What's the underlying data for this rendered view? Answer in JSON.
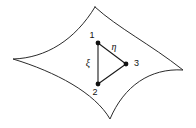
{
  "figure": {
    "name": "curved-surface-with-triangular-element",
    "background_color": "#ffffff",
    "line_color": "#2b2b2b",
    "width": 196,
    "height": 128
  },
  "surface": {
    "name": "curved-surface-patch",
    "description": "four-cusped curvilinear quadrilateral with concave edges",
    "cusps": [
      {
        "label": "top",
        "x": 95,
        "y": 7
      },
      {
        "label": "right",
        "x": 183,
        "y": 70
      },
      {
        "label": "bottom",
        "x": 110,
        "y": 119
      },
      {
        "label": "left",
        "x": 13,
        "y": 59
      }
    ]
  },
  "element": {
    "name": "triangular-element",
    "nodes": [
      {
        "id": "1",
        "label": "1",
        "x": 98,
        "y": 43,
        "label_x": 92,
        "label_y": 36
      },
      {
        "id": "2",
        "label": "2",
        "x": 98,
        "y": 84,
        "label_x": 95,
        "label_y": 92
      },
      {
        "id": "3",
        "label": "3",
        "x": 126,
        "y": 64,
        "label_x": 134,
        "label_y": 64
      }
    ],
    "edges": [
      {
        "from": "1",
        "to": "3"
      },
      {
        "from": "3",
        "to": "2"
      },
      {
        "from": "2",
        "to": "1"
      }
    ]
  },
  "axes": [
    {
      "name": "eta",
      "label": "η",
      "x": 114,
      "y": 48
    },
    {
      "name": "xi",
      "label": "ξ",
      "x": 88,
      "y": 64
    }
  ]
}
